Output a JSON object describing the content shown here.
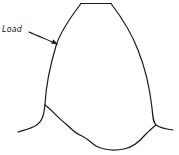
{
  "diagram": {
    "labels": {
      "load": "Load"
    },
    "colors": {
      "stroke": "#1a1a1a",
      "background": "#ffffff"
    }
  }
}
